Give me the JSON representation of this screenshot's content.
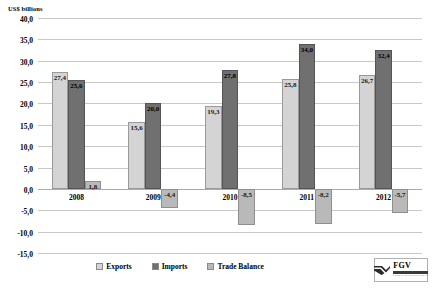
{
  "chart_data": {
    "type": "bar",
    "title": "",
    "subtitle": "",
    "xlabel": "",
    "ylabel": "US$ billions",
    "categories": [
      "2008",
      "2009",
      "2010",
      "2011",
      "2012"
    ],
    "series": [
      {
        "name": "Exports",
        "values": [
          27.4,
          15.6,
          19.3,
          25.8,
          26.7
        ],
        "color": "#d4d4d4"
      },
      {
        "name": "Imports",
        "values": [
          25.6,
          20.0,
          27.8,
          34.0,
          32.4
        ],
        "color": "#707070"
      },
      {
        "name": "Trade Balance",
        "values": [
          1.8,
          -4.4,
          -8.5,
          -8.2,
          -5.7
        ],
        "color": "#b9b9b9"
      }
    ],
    "data_labels": {
      "Exports": [
        "27,4",
        "15,6",
        "19,3",
        "25,8",
        "26,7"
      ],
      "Imports": [
        "25,6",
        "20,0",
        "27,8",
        "34,0",
        "32,4"
      ],
      "Trade Balance": [
        "1,8",
        "-4,4",
        "-8,5",
        "-8,2",
        "-5,7"
      ]
    },
    "ylim": [
      -15.0,
      40.0
    ],
    "ytick_step": 5.0,
    "ytick_labels": [
      "40,0",
      "35,0",
      "30,0",
      "25,0",
      "20,0",
      "15,0",
      "10,0",
      "5,0",
      "0,0",
      "-5,0",
      "-10,0",
      "-15,0"
    ],
    "grid": true,
    "legend_position": "bottom"
  },
  "legend": {
    "items": [
      {
        "label": "Exports"
      },
      {
        "label": "Imports"
      },
      {
        "label": "Trade Balance"
      }
    ]
  },
  "logo": {
    "text": "FGV",
    "subtitle": "FUNDAÇÃO GETULIO VARGAS"
  }
}
